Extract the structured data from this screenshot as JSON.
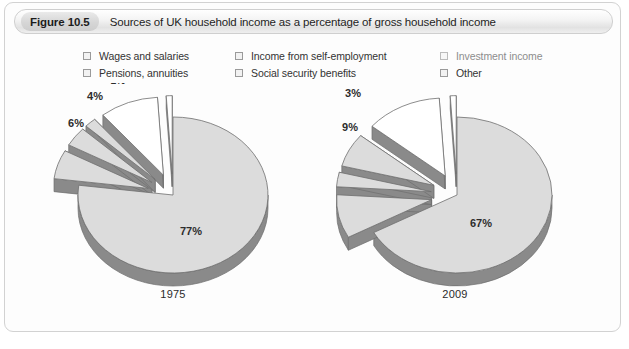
{
  "figure": {
    "number": "Figure 10.5",
    "caption": "Sources of UK household income as a percentage of gross household income"
  },
  "legend": {
    "items": [
      {
        "label": "Wages and salaries",
        "swatch": "checkbox-swatch",
        "muted": false
      },
      {
        "label": "Income from self-employment",
        "swatch": "checkbox-swatch",
        "muted": false
      },
      {
        "label": "Investment income",
        "swatch": "checkbox-swatch",
        "muted": true
      },
      {
        "label": "Pensions, annuities",
        "swatch": "checkbox-swatch",
        "muted": false
      },
      {
        "label": "Social security benefits",
        "swatch": "checkbox-swatch",
        "muted": false
      },
      {
        "label": "Other",
        "swatch": "checkbox-swatch",
        "muted": false
      }
    ]
  },
  "colors": {
    "slice_fill": "#dcdcdc",
    "slice_fill_light": "#ffffff",
    "slice_edge_3d": "#8a8a8a",
    "slice_outline": "#6f6f6f",
    "panel_background": "#fdfdfd",
    "text": "#2c2c2c",
    "text_muted": "#8d8d8d"
  },
  "chart_data": [
    {
      "type": "pie",
      "title": "1975",
      "categories": [
        "Wages and salaries",
        "Pensions, annuities",
        "Income from self-employment",
        "Social security benefits",
        "Investment income",
        "Other"
      ],
      "values": [
        77,
        6,
        4,
        2,
        10,
        1
      ],
      "labels": [
        "77%",
        "6%",
        "4%",
        "2%",
        "10%",
        "1%"
      ],
      "units": "percent of gross household income",
      "exploded": [
        false,
        true,
        true,
        true,
        true,
        true
      ],
      "legend": "top",
      "grid": false
    },
    {
      "type": "pie",
      "title": "2009",
      "categories": [
        "Wages and salaries",
        "Pensions, annuities",
        "Income from self-employment",
        "Social security benefits",
        "Investment income",
        "Other"
      ],
      "values": [
        67,
        9,
        3,
        7,
        13,
        1
      ],
      "labels": [
        "67%",
        "9%",
        "3%",
        "7%",
        "13%",
        "1%"
      ],
      "units": "percent of gross household income",
      "exploded": [
        false,
        true,
        true,
        true,
        true,
        true
      ],
      "legend": "top",
      "grid": false
    }
  ]
}
